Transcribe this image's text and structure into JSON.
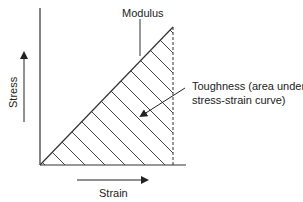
{
  "diagram": {
    "labels": {
      "modulus": "Modulus",
      "toughness_line1": "Toughness (area under",
      "toughness_line2": "stress-strain curve)",
      "stress_axis": "Stress",
      "strain_axis": "Strain"
    },
    "colors": {
      "line": "#333333",
      "hatch": "#444444",
      "background": "#ffffff"
    }
  }
}
